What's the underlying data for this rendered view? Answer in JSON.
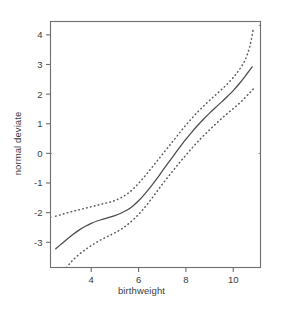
{
  "chart_data": {
    "type": "line",
    "title": "",
    "xlabel": "birthweight",
    "ylabel": "normal deviate",
    "xlim": [
      2.28,
      11.15
    ],
    "ylim": [
      -3.85,
      4.45
    ],
    "xticks": [
      4,
      6,
      8,
      10
    ],
    "xticklabels": [
      "4",
      "6",
      "8",
      "10"
    ],
    "yticks": [
      4,
      3,
      2,
      1,
      0,
      -1,
      -2,
      -3
    ],
    "yticklabels": [
      "4",
      "3",
      "2",
      "1",
      "0",
      "-1",
      "-2",
      "-3"
    ],
    "grid": false,
    "legend": null,
    "box": true,
    "series": [
      {
        "name": "fitted normal deviate",
        "style": "solid",
        "color": "#4a4a4a",
        "x": [
          2.5,
          2.75,
          3.0,
          3.25,
          3.5,
          3.75,
          4.0,
          4.25,
          4.5,
          4.75,
          5.0,
          5.25,
          5.5,
          5.75,
          6.0,
          6.25,
          6.5,
          6.75,
          7.0,
          7.25,
          7.5,
          7.75,
          8.0,
          8.25,
          8.5,
          8.75,
          9.0,
          9.25,
          9.5,
          9.75,
          10.0,
          10.25,
          10.5,
          10.8
        ],
        "y": [
          -3.22,
          -3.05,
          -2.88,
          -2.72,
          -2.58,
          -2.46,
          -2.36,
          -2.28,
          -2.22,
          -2.16,
          -2.1,
          -2.02,
          -1.92,
          -1.78,
          -1.6,
          -1.38,
          -1.14,
          -0.88,
          -0.6,
          -0.32,
          -0.05,
          0.22,
          0.48,
          0.72,
          0.95,
          1.16,
          1.36,
          1.55,
          1.73,
          1.92,
          2.12,
          2.35,
          2.6,
          2.92
        ]
      },
      {
        "name": "upper confidence band",
        "style": "dotted",
        "color": "#5a5a5a",
        "x": [
          2.5,
          2.8,
          3.1,
          3.4,
          3.7,
          4.0,
          4.3,
          4.6,
          4.9,
          5.2,
          5.5,
          5.8,
          6.1,
          6.4,
          6.7,
          7.0,
          7.3,
          7.6,
          7.9,
          8.2,
          8.5,
          8.8,
          9.1,
          9.4,
          9.7,
          10.0,
          10.25,
          10.5,
          10.7,
          10.85
        ],
        "y": [
          -2.12,
          -2.05,
          -1.98,
          -1.92,
          -1.86,
          -1.8,
          -1.74,
          -1.68,
          -1.62,
          -1.52,
          -1.38,
          -1.18,
          -0.92,
          -0.64,
          -0.34,
          -0.04,
          0.26,
          0.56,
          0.86,
          1.14,
          1.4,
          1.64,
          1.86,
          2.08,
          2.3,
          2.56,
          2.82,
          3.15,
          3.62,
          4.22
        ]
      },
      {
        "name": "lower confidence band",
        "style": "dotted",
        "color": "#5a5a5a",
        "x": [
          2.95,
          3.2,
          3.5,
          3.8,
          4.1,
          4.4,
          4.7,
          5.0,
          5.3,
          5.6,
          5.9,
          6.2,
          6.5,
          6.8,
          7.1,
          7.4,
          7.7,
          8.0,
          8.3,
          8.6,
          8.9,
          9.2,
          9.5,
          9.8,
          10.1,
          10.4,
          10.7,
          10.85
        ],
        "y": [
          -3.85,
          -3.62,
          -3.4,
          -3.22,
          -3.06,
          -2.92,
          -2.8,
          -2.68,
          -2.54,
          -2.36,
          -2.14,
          -1.88,
          -1.58,
          -1.26,
          -0.94,
          -0.64,
          -0.34,
          -0.06,
          0.22,
          0.48,
          0.72,
          0.95,
          1.17,
          1.38,
          1.58,
          1.8,
          2.05,
          2.18
        ]
      }
    ],
    "stray_points": [
      {
        "x": 2.3,
        "y": -2.15
      },
      {
        "x": 2.3,
        "y": 0.0
      },
      {
        "x": 11.1,
        "y": 4.32
      },
      {
        "x": 11.1,
        "y": 0.0
      }
    ]
  },
  "axes": {
    "xlabel": "birthweight",
    "ylabel": "normal deviate"
  }
}
